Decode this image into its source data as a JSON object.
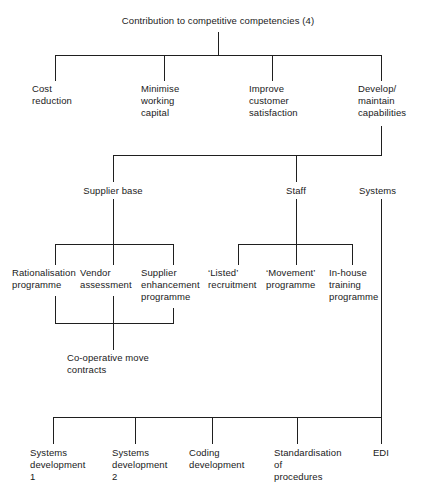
{
  "diagram": {
    "title": "Contribution to competitive competencies (4)",
    "type": "tree-diagram",
    "orientation": "top-down",
    "line_color": "#1f1f1f",
    "background_color": "#ffffff",
    "text_color": "#1a1a1a",
    "root": {
      "label": "Contribution to competitive competencies (4)"
    },
    "level1": {
      "items": [
        {
          "label": "Cost\nreduction"
        },
        {
          "label": "Minimise\nworking\ncapital"
        },
        {
          "label": "Improve\ncustomer\nsatisfaction"
        },
        {
          "label": "Develop/\nmaintain\ncapabilities"
        }
      ]
    },
    "level2": {
      "items": [
        {
          "label": "Supplier base"
        },
        {
          "label": "Staff"
        },
        {
          "label": "Systems"
        }
      ]
    },
    "supplier_base_children": {
      "items": [
        {
          "label": "Rationalisation\nprogramme"
        },
        {
          "label": "Vendor\nassessment"
        },
        {
          "label": "Supplier\nenhancement\nprogramme"
        }
      ]
    },
    "staff_children": {
      "items": [
        {
          "label": "‘Listed’\nrecruitment"
        },
        {
          "label": "‘Movement’\nprogramme"
        },
        {
          "label": "In-house\ntraining\nprogramme"
        }
      ]
    },
    "supplier_merge": {
      "label": "Co-operative move\ncontracts"
    },
    "systems_children": {
      "items": [
        {
          "label": "Systems\ndevelopment\n1"
        },
        {
          "label": "Systems\ndevelopment\n2"
        },
        {
          "label": "Coding\ndevelopment"
        },
        {
          "label": "Standardisation\nof\nprocedures"
        },
        {
          "label": "EDI"
        }
      ]
    }
  }
}
